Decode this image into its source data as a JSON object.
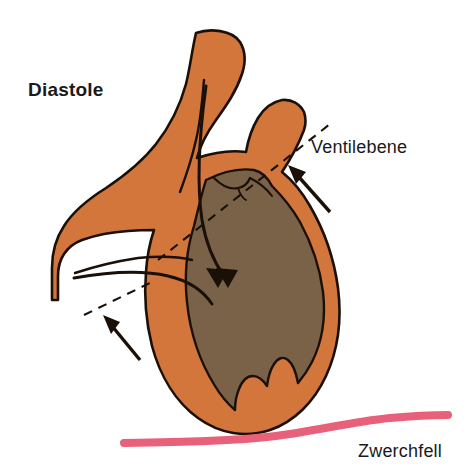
{
  "figure": {
    "title_label": "Diastole",
    "background_color": "#ffffff"
  },
  "labels": {
    "phase": "Diastole",
    "valve_plane": "Ventilebene",
    "diaphragm": "Zwerchfell"
  },
  "colors": {
    "myocardium_orange": "#d2763c",
    "chamber_brown": "#7a6248",
    "outline_black": "#1a1008",
    "diaphragm_pink": "#e8607a",
    "label_text": "#1a1a1a"
  },
  "anatomy": {
    "myocardium_name": "heart-muscle-wall",
    "chamber_name": "ventricular-cavity",
    "aorta_name": "aortic-arch",
    "pulmonary_name": "pulmonary-trunk",
    "vena_cava_name": "vena-cava-stump",
    "apex_name": "heart-apex-trabeculae"
  },
  "annotations": {
    "valve_plane_line": "dashed-valve-plane",
    "arrow_right": "valve-plane-motion-arrow-right",
    "arrow_left": "valve-plane-motion-arrow-left",
    "flow_arrow_aortic": "blood-inflow-arrow-upper",
    "flow_arrow_venous": "blood-inflow-arrow-lower"
  }
}
